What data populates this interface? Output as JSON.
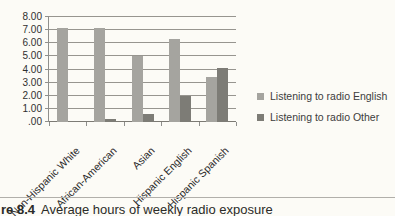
{
  "chart_data": {
    "type": "bar",
    "title": "",
    "xlabel": "",
    "ylabel": "",
    "categories": [
      "Non-Hispanic White",
      "African-American",
      "Asian",
      "Hispanic English",
      "Hispanic Spanish"
    ],
    "series": [
      {
        "name": "Listening to radio English",
        "color": "#a5a49f",
        "values": [
          7.2,
          7.2,
          5.0,
          6.3,
          3.4
        ]
      },
      {
        "name": "Listening to radio Other",
        "color": "#7d7c76",
        "values": [
          0.1,
          0.2,
          0.6,
          2.0,
          4.1
        ]
      }
    ],
    "ylim": [
      0,
      8
    ],
    "ytick_step": 1,
    "ytick_labels_bottom_to_top": [
      ".00",
      "1.00",
      "2.00",
      "3.00",
      "4.00",
      "5.00",
      "6.00",
      "7.00",
      "8.00"
    ],
    "grid": true,
    "legend_position": "right"
  },
  "caption": {
    "label": "re 8.4",
    "text": "Average hours of weekly radio exposure"
  }
}
